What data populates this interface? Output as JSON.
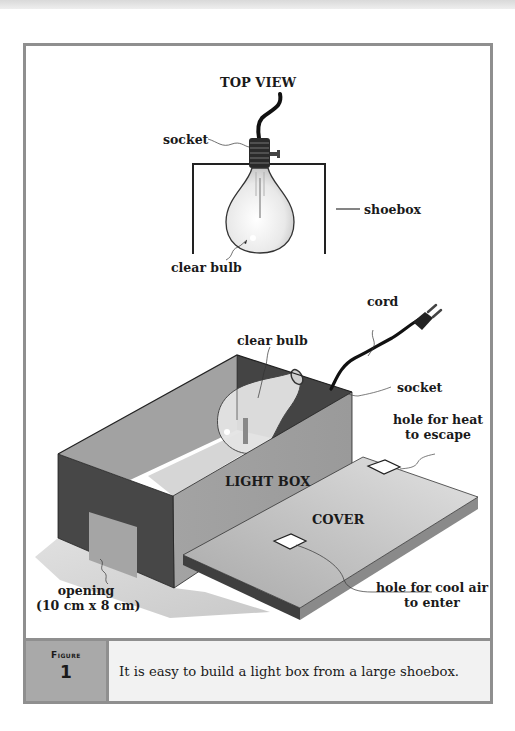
{
  "figure": {
    "top_view": {
      "title": "TOP VIEW",
      "labels": {
        "socket": "socket",
        "shoebox": "shoebox",
        "clear_bulb": "clear bulb"
      }
    },
    "light_box_view": {
      "labels": {
        "cord": "cord",
        "clear_bulb": "clear bulb",
        "socket": "socket",
        "hole_heat_line1": "hole for heat",
        "hole_heat_line2": "to escape",
        "light_box": "LIGHT BOX",
        "cover": "COVER",
        "opening_line1": "opening",
        "opening_line2": "(10 cm x 8 cm)",
        "hole_cool_line1": "hole for cool air",
        "hole_cool_line2": "to enter"
      }
    },
    "caption": {
      "label": "Figure",
      "number": "1",
      "text": "It is easy to build a light box from a large shoebox."
    },
    "colors": {
      "frame": "#8f8f8f",
      "caption_label_bg": "#a9a9a9",
      "caption_text_bg": "#f2f2f2",
      "box_dark": "#4a4a4a",
      "box_mid": "#8a8a8a",
      "box_light": "#b8b8b8"
    }
  }
}
